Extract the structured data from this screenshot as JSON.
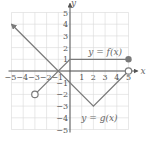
{
  "chart_data": {
    "type": "line",
    "title": "",
    "xlabel": "x",
    "ylabel": "y",
    "xlim": [
      -5,
      5
    ],
    "ylim": [
      -5,
      5
    ],
    "grid": true,
    "x_ticks": [
      "-5",
      "-4",
      "-3",
      "-2",
      "-1",
      "1",
      "2",
      "3",
      "4",
      "5"
    ],
    "y_ticks": [
      "5",
      "4",
      "3",
      "2",
      "1",
      "-1",
      "-2",
      "-3",
      "-4",
      "-5"
    ],
    "series": [
      {
        "name": "y = f(x)",
        "points": [
          [
            -3,
            -2
          ],
          [
            0,
            1
          ],
          [
            5,
            1
          ]
        ],
        "start": {
          "point": [
            -3,
            -2
          ],
          "marker": "open-circle"
        },
        "end": {
          "point": [
            5,
            1
          ],
          "marker": "closed-dot"
        },
        "label_position": [
          3,
          1.6
        ]
      },
      {
        "name": "y = g(x)",
        "points": [
          [
            -5,
            4
          ],
          [
            2,
            -3
          ],
          [
            5,
            0
          ]
        ],
        "start": {
          "point": [
            -5,
            4
          ],
          "marker": "arrow"
        },
        "end": {
          "point": [
            5,
            0
          ],
          "marker": "open-circle"
        },
        "label_position": [
          2,
          -4
        ]
      }
    ],
    "colors": {
      "curve": "#7a7a7a",
      "grid": "#d9d9d9",
      "axis": "#555555"
    }
  },
  "labels": {
    "x_axis": "x",
    "y_axis": "y",
    "f_label": "y = f(x)",
    "g_label": "y = g(x)"
  }
}
